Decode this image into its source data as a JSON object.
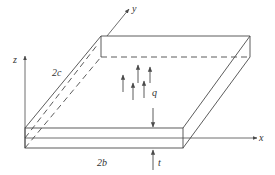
{
  "figure": {
    "axes": {
      "x_label": "x",
      "y_label": "y",
      "z_label": "z"
    },
    "dimensions": {
      "width_label": "2b",
      "depth_label": "2c",
      "thickness_label": "t"
    },
    "load": {
      "label": "q",
      "direction": "up",
      "arrow_count": 6
    },
    "colors": {
      "line": "#4a4a4a",
      "background": "#ffffff"
    }
  }
}
